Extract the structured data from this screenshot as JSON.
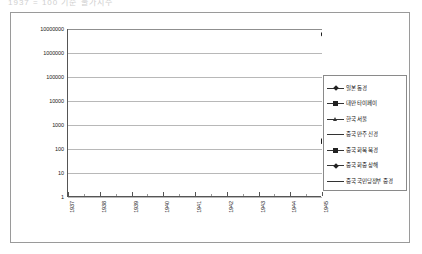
{
  "title_strip": "1937 = 100 기준 물가지수",
  "legend": {
    "items": [
      {
        "label": "일본 동경",
        "marker": "diamond"
      },
      {
        "label": "대만 타이페이",
        "marker": "square"
      },
      {
        "label": "한국 서울",
        "marker": "tri"
      },
      {
        "label": "중국 만주 신경",
        "marker": "none"
      },
      {
        "label": "중국 화북 북경",
        "marker": "square"
      },
      {
        "label": "중국 화중 상해",
        "marker": "diamond"
      },
      {
        "label": "중국 국민당정부 중경",
        "marker": "none"
      }
    ]
  },
  "chart_data": {
    "type": "line",
    "title": "1937 = 100 기준 물가지수",
    "xlabel": "",
    "ylabel": "",
    "x": [
      "1937",
      "1938",
      "1939",
      "1940",
      "1941",
      "1942",
      "1943",
      "1944",
      "1945"
    ],
    "x_tick_labels": [
      "1937",
      "1938",
      "1939",
      "1940",
      "1941",
      "1942",
      "1943",
      "1944",
      "1945"
    ],
    "y_tick_labels": [
      "1",
      "10",
      "100",
      "1000",
      "10000",
      "100000",
      "1000000",
      "10000000"
    ],
    "y_scale": "log",
    "ylim": [
      1,
      10000000
    ],
    "grid": true,
    "legend_position": "right",
    "series": [
      {
        "name": "일본 동경",
        "marker": "diamond",
        "x": [
          "1937",
          "1937.5",
          "1938",
          "1938.5",
          "1939",
          "1939.5",
          "1940",
          "1940.5",
          "1941",
          "1941.5",
          "1942",
          "1942.5",
          "1943",
          "1943.5",
          "1944",
          "1944.5",
          "1945"
        ],
        "values": [
          100,
          103,
          108,
          112,
          118,
          122,
          126,
          130,
          134,
          137,
          140,
          143,
          147,
          152,
          160,
          200,
          230
        ]
      },
      {
        "name": "대만 타이페이",
        "marker": "square",
        "x": [
          "1937",
          "1937.5",
          "1938",
          "1938.5",
          "1939",
          "1939.5",
          "1940",
          "1940.5",
          "1941",
          "1941.5",
          "1942",
          "1942.5",
          "1943",
          "1943.5",
          "1944",
          "1944.5",
          "1945"
        ],
        "values": [
          100,
          98,
          102,
          108,
          118,
          130,
          126,
          132,
          134,
          138,
          142,
          145,
          152,
          158,
          168,
          178,
          190
        ]
      },
      {
        "name": "한국 서울",
        "marker": "tri",
        "x": [
          "1937",
          "1937.5",
          "1938",
          "1938.5",
          "1939",
          "1939.5",
          "1940",
          "1940.5",
          "1941",
          "1941.5",
          "1942",
          "1942.5",
          "1943",
          "1943.5",
          "1944",
          "1944.5"
        ],
        "values": [
          100,
          104,
          110,
          118,
          140,
          165,
          175,
          185,
          195,
          205,
          215,
          225,
          240,
          255,
          280,
          330
        ]
      },
      {
        "name": "중국 만주 신경",
        "marker": "none",
        "x": [
          "1937",
          "1937.5",
          "1938",
          "1938.5",
          "1939",
          "1939.5",
          "1940",
          "1940.5",
          "1941",
          "1941.5",
          "1942",
          "1942.5",
          "1943",
          "1943.5",
          "1944",
          "1944.5"
        ],
        "values": [
          100,
          106,
          115,
          135,
          230,
          330,
          420,
          480,
          540,
          600,
          680,
          780,
          900,
          1050,
          1250,
          1700
        ]
      },
      {
        "name": "중국 화북 북경",
        "marker": "square",
        "x": [
          "1937",
          "1937.5",
          "1938",
          "1938.5",
          "1939",
          "1939.5",
          "1940",
          "1940.5",
          "1941",
          "1941.5",
          "1942",
          "1942.5",
          "1943",
          "1943.5",
          "1944",
          "1944.5"
        ],
        "values": [
          100,
          108,
          120,
          150,
          250,
          380,
          430,
          500,
          700,
          1200,
          2000,
          3500,
          5500,
          13000,
          45000,
          190000
        ]
      },
      {
        "name": "중국 화중 상해",
        "marker": "diamond",
        "x": [
          "1937",
          "1937.5",
          "1938",
          "1938.5",
          "1939",
          "1939.5",
          "1940",
          "1940.5",
          "1941",
          "1941.5",
          "1942",
          "1942.5",
          "1943",
          "1943.5",
          "1944",
          "1944.5",
          "1945"
        ],
        "values": [
          100,
          105,
          118,
          145,
          260,
          400,
          480,
          560,
          760,
          1250,
          2100,
          3600,
          5800,
          14000,
          52000,
          2200000,
          6000000
        ]
      },
      {
        "name": "중국 국민당정부 중경",
        "marker": "none",
        "x": [
          "1937",
          "1937.5",
          "1938",
          "1938.5",
          "1939",
          "1939.5",
          "1940",
          "1940.5",
          "1941",
          "1941.5",
          "1942",
          "1942.5",
          "1943",
          "1943.5",
          "1944",
          "1944.5"
        ],
        "values": [
          100,
          108,
          125,
          160,
          270,
          420,
          520,
          620,
          850,
          1400,
          2400,
          4200,
          7000,
          16000,
          60000,
          200000
        ]
      }
    ]
  }
}
